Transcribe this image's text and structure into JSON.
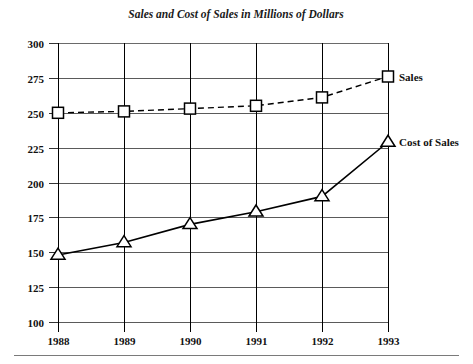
{
  "chart_data": {
    "type": "line",
    "title": "Sales and Cost of Sales in Millions of Dollars",
    "xlabel": "",
    "ylabel": "",
    "categories": [
      "1988",
      "1989",
      "1990",
      "1991",
      "1992",
      "1993"
    ],
    "x": [
      1988,
      1989,
      1990,
      1991,
      1992,
      1993
    ],
    "ylim": [
      100,
      300
    ],
    "ytick_step": 25,
    "ytick_labels": [
      "300",
      "275",
      "250",
      "225",
      "200",
      "175",
      "150",
      "125",
      "100"
    ],
    "ytick_values": [
      300,
      275,
      250,
      225,
      200,
      175,
      150,
      125,
      100
    ],
    "grid": "both",
    "legend_position": "inline-right-end",
    "series": [
      {
        "name": "Sales",
        "label": "Sales",
        "marker": "square",
        "line_style": "dashed",
        "color": "#000000",
        "values": [
          250,
          251,
          253,
          255,
          261,
          276
        ]
      },
      {
        "name": "Cost of Sales",
        "label": "Cost of Sales",
        "marker": "triangle",
        "line_style": "solid",
        "color": "#000000",
        "values": [
          148,
          157,
          170,
          179,
          190,
          229
        ]
      }
    ]
  },
  "page": {
    "background_color": "#ffffff",
    "ink_color": "#000000"
  }
}
